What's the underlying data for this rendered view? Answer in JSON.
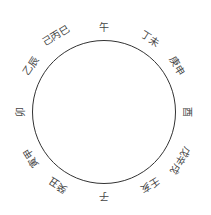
{
  "diagram": {
    "type": "direction-ring",
    "circle": {
      "cx": 104,
      "cy": 112,
      "r": 72,
      "stroke": "#333333"
    },
    "label_color": "#444444",
    "labels": [
      {
        "text": "午",
        "angle": 0,
        "dist": 84
      },
      {
        "text": "丁未",
        "angle": 32,
        "dist": 86
      },
      {
        "text": "庚申",
        "angle": 58,
        "dist": 86
      },
      {
        "text": "酉",
        "angle": 90,
        "dist": 83
      },
      {
        "text": "戊辛戌",
        "angle": 122,
        "dist": 90
      },
      {
        "text": "壬亥",
        "angle": 148,
        "dist": 86
      },
      {
        "text": "子",
        "angle": 180,
        "dist": 84
      },
      {
        "text": "癸丑",
        "angle": 212,
        "dist": 86
      },
      {
        "text": "寅甲",
        "angle": 238,
        "dist": 86
      },
      {
        "text": "卯",
        "angle": 270,
        "dist": 83
      },
      {
        "text": "乙辰",
        "angle": 302,
        "dist": 86
      },
      {
        "text": "己丙巳",
        "angle": 328,
        "dist": 90
      }
    ]
  }
}
